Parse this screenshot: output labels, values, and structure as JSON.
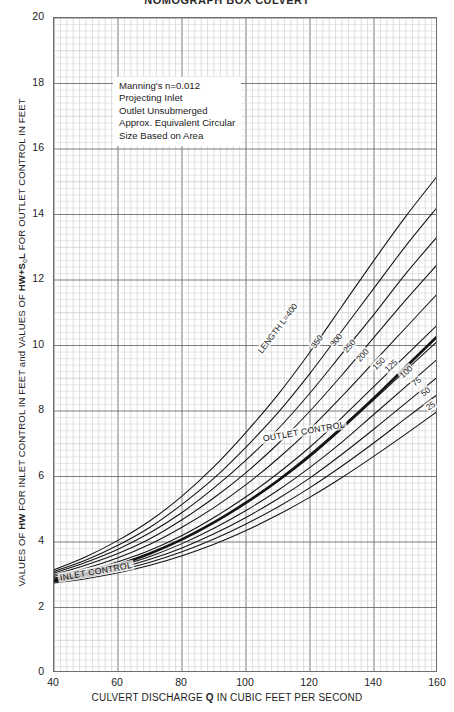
{
  "page": {
    "title_partial": "NOMOGRAPH  BOX CULVERT"
  },
  "note": {
    "lines": [
      "Manning's n=0.012",
      "Projecting Inlet",
      "Outlet Unsubmerged",
      "Approx. Equivalent Circular",
      "Size Based on Area"
    ]
  },
  "annotations": {
    "outlet_control": "OUTLET CONTROL",
    "inlet_control": "INLET CONTROL",
    "length_prefix": "LENGTH L=400"
  },
  "axes": {
    "x_title_pre": "CULVERT DISCHARGE ",
    "x_title_bold": "Q",
    "x_title_post": " IN CUBIC FEET PER SECOND",
    "y_title_pre": "VALUES OF ",
    "y_title_bold1": "HW",
    "y_title_mid": " FOR INLET CONTROL IN FEET and VALUES OF ",
    "y_title_bold2": "HW+S",
    "y_title_sub": "o",
    "y_title_bold3": "L",
    "y_title_post": " FOR OUTLET CONTROL IN FEET",
    "x_ticks": [
      40,
      60,
      80,
      100,
      120,
      140,
      160
    ],
    "y_ticks": [
      0,
      2,
      4,
      6,
      8,
      10,
      12,
      14,
      16,
      18,
      20
    ]
  },
  "chart_data": {
    "type": "line",
    "title": "NOMOGRAPH  BOX CULVERT",
    "xlabel": "CULVERT DISCHARGE Q IN CUBIC FEET PER SECOND",
    "ylabel": "VALUES OF HW FOR INLET CONTROL IN FEET and VALUES OF HW+SoL FOR OUTLET CONTROL IN FEET",
    "xlim": [
      40,
      160
    ],
    "ylim": [
      0,
      20
    ],
    "x_major_step": 20,
    "x_minor_step": 2,
    "y_major_step": 2,
    "y_minor_step": 0.2,
    "grid": true,
    "legend": "none",
    "x": [
      40,
      50,
      60,
      70,
      80,
      90,
      100,
      110,
      120,
      130,
      140,
      150,
      160
    ],
    "series": [
      {
        "name": "L=400",
        "label": "LENGTH L=400",
        "emphasis": "normal",
        "values": [
          3.15,
          3.55,
          4.05,
          4.65,
          5.4,
          6.3,
          7.35,
          8.5,
          9.8,
          11.2,
          12.6,
          13.95,
          15.2
        ]
      },
      {
        "name": "L=350",
        "label": "350",
        "emphasis": "normal",
        "values": [
          3.1,
          3.45,
          3.9,
          4.45,
          5.15,
          5.95,
          6.9,
          7.95,
          9.15,
          10.45,
          11.75,
          13.05,
          14.25
        ]
      },
      {
        "name": "L=300",
        "label": "300",
        "emphasis": "normal",
        "values": [
          3.05,
          3.38,
          3.78,
          4.28,
          4.9,
          5.65,
          6.5,
          7.45,
          8.55,
          9.75,
          10.95,
          12.2,
          13.35
        ]
      },
      {
        "name": "L=250",
        "label": "250",
        "emphasis": "normal",
        "values": [
          3.0,
          3.3,
          3.65,
          4.1,
          4.68,
          5.35,
          6.12,
          7.0,
          8.0,
          9.1,
          10.25,
          11.4,
          12.5
        ]
      },
      {
        "name": "L=200",
        "label": "200",
        "emphasis": "normal",
        "values": [
          2.95,
          3.2,
          3.52,
          3.93,
          4.45,
          5.05,
          5.75,
          6.55,
          7.45,
          8.45,
          9.5,
          10.55,
          11.6
        ]
      },
      {
        "name": "L=150",
        "label": "150",
        "emphasis": "normal",
        "values": [
          2.9,
          3.12,
          3.4,
          3.75,
          4.2,
          4.75,
          5.38,
          6.1,
          6.9,
          7.8,
          8.75,
          9.7,
          10.65
        ]
      },
      {
        "name": "L=125",
        "label": "125",
        "emphasis": "normal",
        "values": [
          2.87,
          3.07,
          3.33,
          3.66,
          4.08,
          4.6,
          5.18,
          5.85,
          6.6,
          7.45,
          8.35,
          9.25,
          10.15
        ]
      },
      {
        "name": "inlet-control",
        "label": "",
        "emphasis": "bold",
        "values": [
          2.82,
          3.02,
          3.3,
          3.65,
          4.08,
          4.6,
          5.2,
          5.88,
          6.65,
          7.5,
          8.4,
          9.35,
          10.3
        ]
      },
      {
        "name": "L=100",
        "label": "100",
        "emphasis": "normal",
        "values": [
          2.84,
          3.02,
          3.26,
          3.56,
          3.95,
          4.42,
          4.96,
          5.58,
          6.28,
          7.05,
          7.9,
          8.75,
          9.6
        ]
      },
      {
        "name": "L=75",
        "label": "75",
        "emphasis": "normal",
        "values": [
          2.81,
          2.97,
          3.19,
          3.47,
          3.82,
          4.25,
          4.75,
          5.32,
          5.96,
          6.68,
          7.45,
          8.25,
          9.05
        ]
      },
      {
        "name": "L=50",
        "label": "50",
        "emphasis": "normal",
        "values": [
          2.78,
          2.93,
          3.13,
          3.38,
          3.7,
          4.09,
          4.55,
          5.07,
          5.66,
          6.32,
          7.03,
          7.78,
          8.52
        ]
      },
      {
        "name": "L=25",
        "label": "25",
        "emphasis": "normal",
        "values": [
          2.75,
          2.88,
          3.06,
          3.29,
          3.58,
          3.93,
          4.35,
          4.83,
          5.37,
          5.97,
          6.62,
          7.3,
          8.0
        ]
      }
    ]
  }
}
